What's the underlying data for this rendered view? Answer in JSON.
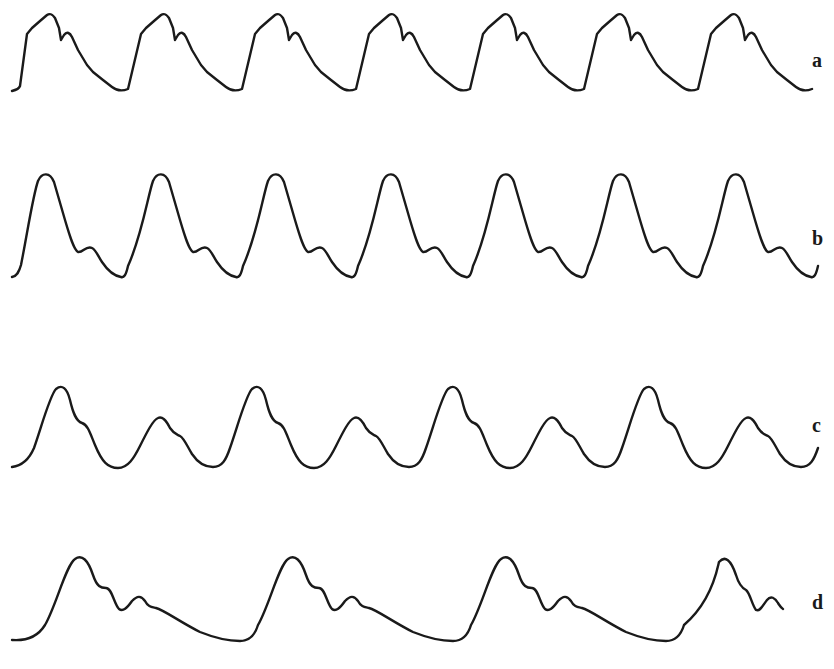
{
  "figure": {
    "stroke_color": "#1a1a1a",
    "background": "#ffffff",
    "traces": [
      {
        "id": "a",
        "label": "a",
        "cycles": 7,
        "shape": "steep upstroke with shoulder, notch on downstroke"
      },
      {
        "id": "b",
        "label": "b",
        "cycles": 7,
        "shape": "tall rounded peak, distinct dicrotic wave"
      },
      {
        "id": "c",
        "label": "c",
        "cycles": 8,
        "shape": "alternating large and small pulses (pulsus alternans)"
      },
      {
        "id": "d",
        "label": "d",
        "cycles": 4,
        "shape": "slow rise, multiple secondary oscillations"
      }
    ]
  }
}
